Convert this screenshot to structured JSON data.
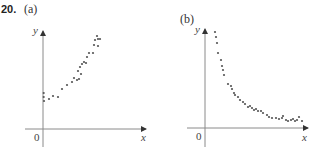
{
  "problem": {
    "number": "20.",
    "panels": [
      {
        "label": "(a)",
        "x_axis_label": "x",
        "y_axis_label": "y",
        "origin_label": "0"
      },
      {
        "label": "(b)",
        "x_axis_label": "x",
        "y_axis_label": "y",
        "origin_label": "0"
      }
    ]
  },
  "colors": {
    "axis": "#8a8a8a",
    "dot": "#555555",
    "text": "#333333"
  },
  "chart_data": [
    {
      "type": "scatter",
      "title": "(a)",
      "xlabel": "x",
      "ylabel": "y",
      "grid": false,
      "description": "Increasing, concave-up (exponential-growth-like) trend",
      "points_px": [
        [
          43.7,
          93
        ],
        [
          43.7,
          97
        ],
        [
          44,
          101
        ],
        [
          49,
          99
        ],
        [
          53,
          96
        ],
        [
          58,
          97
        ],
        [
          62,
          89
        ],
        [
          67,
          85
        ],
        [
          72,
          82
        ],
        [
          74,
          78
        ],
        [
          77,
          80
        ],
        [
          79,
          79
        ],
        [
          81,
          74
        ],
        [
          78,
          71
        ],
        [
          80,
          67
        ],
        [
          82,
          64
        ],
        [
          84,
          62
        ],
        [
          86,
          63
        ],
        [
          87,
          57
        ],
        [
          89,
          53
        ],
        [
          93,
          53
        ],
        [
          94,
          45
        ],
        [
          95,
          40
        ],
        [
          97,
          36
        ],
        [
          98,
          39
        ],
        [
          100,
          39
        ],
        [
          98,
          46
        ]
      ]
    },
    {
      "type": "scatter",
      "title": "(b)",
      "xlabel": "x",
      "ylabel": "y",
      "grid": false,
      "description": "Decreasing, concave-up (exponential-decay-like) trend leveling toward the x-axis",
      "points_px": [
        [
          215,
          32
        ],
        [
          216,
          37
        ],
        [
          217,
          43
        ],
        [
          218,
          53
        ],
        [
          221,
          60
        ],
        [
          222,
          66
        ],
        [
          223,
          70
        ],
        [
          224,
          75
        ],
        [
          228,
          84
        ],
        [
          231,
          86
        ],
        [
          232,
          89
        ],
        [
          234,
          93
        ],
        [
          235,
          95
        ],
        [
          238,
          97
        ],
        [
          240,
          100
        ],
        [
          243,
          102
        ],
        [
          245,
          104
        ],
        [
          248,
          107
        ],
        [
          250,
          106
        ],
        [
          252,
          108
        ],
        [
          254,
          110
        ],
        [
          256,
          109
        ],
        [
          258,
          111
        ],
        [
          261,
          111
        ],
        [
          263,
          113
        ],
        [
          267,
          115
        ],
        [
          269,
          117
        ],
        [
          272,
          118
        ],
        [
          276,
          118
        ],
        [
          279,
          119
        ],
        [
          282,
          118
        ],
        [
          283,
          116
        ],
        [
          286,
          120
        ],
        [
          288,
          121
        ],
        [
          291,
          120
        ],
        [
          293,
          119
        ],
        [
          295,
          121
        ],
        [
          297,
          120
        ],
        [
          299,
          117
        ],
        [
          302,
          121
        ]
      ]
    }
  ]
}
